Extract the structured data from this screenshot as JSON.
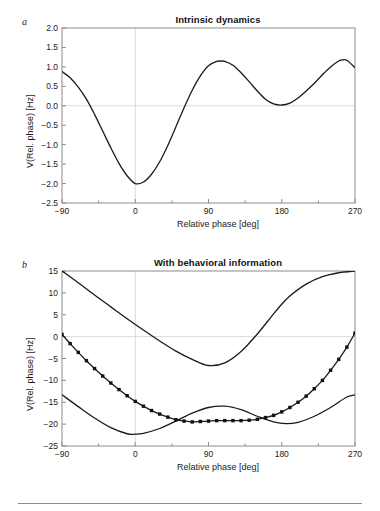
{
  "figure": {
    "panels": [
      {
        "letter": "a",
        "title": "Intrinsic dynamics",
        "xlabel": "Relative phase [deg]",
        "ylabel": "V(Rel. phase) [Hz]"
      },
      {
        "letter": "b",
        "title": "With behavioral information",
        "xlabel": "Relative phase [deg]",
        "ylabel": "V(Rel. phase) [Hz]"
      }
    ]
  },
  "chart_data": [
    {
      "type": "line",
      "title": "Intrinsic dynamics",
      "xlabel": "Relative phase [deg]",
      "ylabel": "V(Rel. phase) [Hz]",
      "xlim": [
        -90,
        270
      ],
      "ylim": [
        -2.5,
        2.0
      ],
      "xticks": [
        -90,
        0,
        90,
        180,
        270
      ],
      "xtick_labels": [
        "−90",
        "0",
        "90",
        "180",
        "270"
      ],
      "xminor_ticks": [
        -45,
        45,
        135,
        225
      ],
      "yticks": [
        2.0,
        1.5,
        1.0,
        0.5,
        0.0,
        -0.5,
        -1.0,
        -1.5,
        -2.0,
        -2.5
      ],
      "ytick_labels": [
        "2.0",
        "1.5",
        "1.0",
        "0.5",
        "0.0",
        "−0.5",
        "−1.0",
        "−1.5",
        "−2.0",
        "−2.5"
      ],
      "grid": false,
      "zero_line_y": 0.0,
      "zero_line_x": 0,
      "legend": null,
      "series": [
        {
          "name": "intrinsic potential",
          "marker": "none",
          "x": [
            -90,
            -80,
            -70,
            -60,
            -50,
            -40,
            -30,
            -20,
            -10,
            0,
            10,
            20,
            30,
            40,
            50,
            60,
            70,
            80,
            90,
            100,
            105,
            110,
            120,
            130,
            140,
            150,
            160,
            170,
            180,
            190,
            200,
            210,
            220,
            230,
            240,
            250,
            255,
            260,
            270
          ],
          "y": [
            0.88,
            0.72,
            0.48,
            0.17,
            -0.22,
            -0.65,
            -1.08,
            -1.48,
            -1.8,
            -2.0,
            -1.96,
            -1.76,
            -1.44,
            -1.02,
            -0.54,
            -0.05,
            0.4,
            0.77,
            1.03,
            1.14,
            1.15,
            1.14,
            1.04,
            0.85,
            0.62,
            0.38,
            0.17,
            0.05,
            0.02,
            0.07,
            0.2,
            0.38,
            0.58,
            0.8,
            1.0,
            1.15,
            1.18,
            1.17,
            0.98
          ]
        }
      ]
    },
    {
      "type": "line",
      "title": "With behavioral information",
      "xlabel": "Relative phase [deg]",
      "ylabel": "V(Rel. phase) [Hz]",
      "xlim": [
        -90,
        270
      ],
      "ylim": [
        -25,
        15
      ],
      "xticks": [
        -90,
        0,
        90,
        180,
        270
      ],
      "xtick_labels": [
        "−90",
        "0",
        "90",
        "180",
        "270"
      ],
      "xminor_ticks": [
        -45,
        45,
        135,
        225
      ],
      "yticks": [
        15,
        10,
        5,
        0,
        -5,
        -10,
        -15,
        -20,
        -25
      ],
      "ytick_labels": [
        "15",
        "10",
        "5",
        "0",
        "−5",
        "−10",
        "−15",
        "−20",
        "−25"
      ],
      "grid": false,
      "zero_line_y": 0,
      "zero_line_x": 0,
      "legend": null,
      "series": [
        {
          "name": "behavioral requirement",
          "marker": "none",
          "x": [
            -90,
            -70,
            -50,
            -30,
            -10,
            10,
            30,
            50,
            70,
            90,
            110,
            130,
            150,
            170,
            180,
            190,
            210,
            230,
            250,
            270
          ],
          "y": [
            15.0,
            12.3,
            9.5,
            6.8,
            4.1,
            1.5,
            -1.0,
            -3.3,
            -5.2,
            -6.6,
            -6.0,
            -3.4,
            0.6,
            5.2,
            7.4,
            9.3,
            12.0,
            13.7,
            14.6,
            15.0
          ]
        },
        {
          "name": "intrinsic scaled",
          "marker": "none",
          "x": [
            -90,
            -70,
            -50,
            -30,
            -10,
            0,
            10,
            30,
            50,
            70,
            90,
            110,
            130,
            150,
            170,
            185,
            200,
            220,
            240,
            260,
            270
          ],
          "y": [
            -13.3,
            -16.0,
            -18.6,
            -20.8,
            -22.2,
            -22.3,
            -22.1,
            -21.0,
            -19.3,
            -17.5,
            -16.2,
            -15.9,
            -16.7,
            -18.2,
            -19.5,
            -19.9,
            -19.6,
            -18.2,
            -16.2,
            -13.8,
            -13.3
          ]
        },
        {
          "name": "resulting potential",
          "marker": "square",
          "x": [
            -90,
            -80,
            -70,
            -60,
            -50,
            -40,
            -30,
            -20,
            -10,
            0,
            10,
            20,
            30,
            40,
            50,
            60,
            70,
            80,
            90,
            100,
            110,
            120,
            130,
            140,
            150,
            160,
            170,
            180,
            190,
            200,
            210,
            220,
            230,
            240,
            250,
            260,
            270
          ],
          "y": [
            0.5,
            -1.6,
            -3.6,
            -5.5,
            -7.3,
            -9.0,
            -10.6,
            -12.1,
            -13.5,
            -14.8,
            -15.9,
            -16.9,
            -17.7,
            -18.4,
            -19.0,
            -19.3,
            -19.5,
            -19.4,
            -19.3,
            -19.2,
            -19.2,
            -19.2,
            -19.2,
            -19.1,
            -18.9,
            -18.5,
            -18.0,
            -17.2,
            -16.2,
            -15.0,
            -13.6,
            -11.9,
            -10.0,
            -7.7,
            -5.2,
            -2.4,
            0.8
          ]
        }
      ]
    }
  ]
}
